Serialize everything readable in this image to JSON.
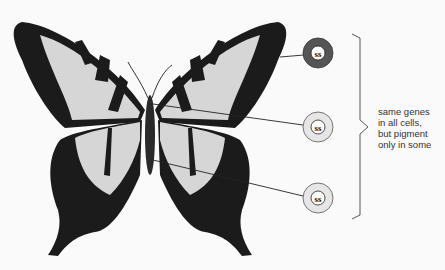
{
  "diagram": {
    "cells": [
      {
        "id": "cell-1",
        "type": "pigmented",
        "color": "#555555",
        "nucleus_glyph": "ss"
      },
      {
        "id": "cell-2",
        "type": "unpigmented",
        "color": "#e6e6e6",
        "nucleus_glyph": "ss"
      },
      {
        "id": "cell-3",
        "type": "unpigmented",
        "color": "#e6e6e6",
        "nucleus_glyph": "ss"
      }
    ],
    "caption_lines": [
      "same genes",
      "in all cells,",
      "but pigment",
      "only in some"
    ],
    "colors": {
      "background": "#fafafa",
      "wing_dark": "#1a1a1a",
      "wing_light": "#d9d9d9",
      "dark_cell": "#555555",
      "light_cell": "#e6e6e6"
    }
  }
}
